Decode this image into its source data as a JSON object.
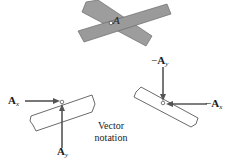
{
  "figure": {
    "top_joint": {
      "point_label": "A",
      "strip_color": "#9a9a9a",
      "outline_color": "#555555"
    },
    "left_member": {
      "force_x": {
        "symbol": "A",
        "subscript": "x"
      },
      "force_y": {
        "symbol": "A",
        "subscript": "y"
      }
    },
    "right_member": {
      "force_x": {
        "sign": "−",
        "symbol": "A",
        "subscript": "x"
      },
      "force_y": {
        "sign": "−",
        "symbol": "A",
        "subscript": "y"
      }
    },
    "caption": {
      "line1": "Vector",
      "line2": "notation"
    },
    "arrow_color": "#555555"
  }
}
